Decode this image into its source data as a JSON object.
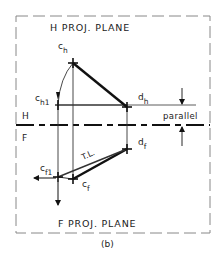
{
  "figure": {
    "caption": "(b)",
    "frame_color": "#888888",
    "line_color": "#111111"
  },
  "planes": {
    "h_title": "H PROJ. PLANE",
    "f_title": "F PROJ. PLANE",
    "h_label": "H",
    "f_label": "F"
  },
  "points": {
    "c_h": {
      "main": "c",
      "sub": "h"
    },
    "c_h1": {
      "main": "c",
      "sub": "h1"
    },
    "d_h": {
      "main": "d",
      "sub": "h"
    },
    "d_f": {
      "main": "d",
      "sub": "f"
    },
    "c_f1": {
      "main": "c",
      "sub": "f1"
    },
    "c_f": {
      "main": "c",
      "sub": "f"
    }
  },
  "annotations": {
    "parallel": "parallel",
    "true_length": "T.L."
  }
}
